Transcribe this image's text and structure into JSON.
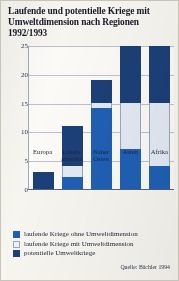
{
  "figure": {
    "title": "Laufende und potentielle Kriege mit Umweltdimension nach Regionen 1992/1993",
    "source": "Quelle: Bächler 1994"
  },
  "legend": {
    "items": [
      {
        "label": "laufende Kriege ohne Umweltdimension",
        "color": "#1f5fb4"
      },
      {
        "label": "laufende Kriege mit Umweltdimension",
        "color": "#eef2f8"
      },
      {
        "label": "potentielle Umweltkriege",
        "color": "#1b3f77"
      }
    ]
  },
  "axis": {
    "yticks": [
      "0",
      "5",
      "10",
      "15",
      "20",
      "25"
    ],
    "xticks": [
      "Europa",
      "Latein-\namerika",
      "Naher\nOsten",
      "Asien",
      "Afrika"
    ]
  },
  "chart_data": {
    "type": "bar",
    "title": "Laufende und potentielle Kriege mit Umweltdimension nach Regionen 1992/1993",
    "subtitle": "",
    "xlabel": "",
    "ylabel": "",
    "stacked": true,
    "grid": true,
    "legend_position": "below",
    "ylim": [
      0,
      25
    ],
    "yticks": [
      0,
      5,
      10,
      15,
      20,
      25
    ],
    "categories": [
      "Europa",
      "Lateinamerika",
      "Naher Osten",
      "Asien",
      "Afrika"
    ],
    "series": [
      {
        "name": "laufende Kriege ohne Umweltdimension",
        "color": "#1f5fb4",
        "values": [
          0,
          2,
          14,
          7,
          4
        ]
      },
      {
        "name": "laufende Kriege mit Umweltdimension",
        "color": "#eef2f8",
        "values": [
          0,
          2,
          1,
          8,
          11
        ]
      },
      {
        "name": "potentielle Umweltkriege",
        "color": "#1b3f77",
        "values": [
          3,
          7,
          4,
          10,
          10
        ]
      }
    ],
    "totals": [
      3,
      11,
      19,
      25,
      25
    ],
    "annotations": [
      "Quelle: Bächler 1994"
    ]
  }
}
